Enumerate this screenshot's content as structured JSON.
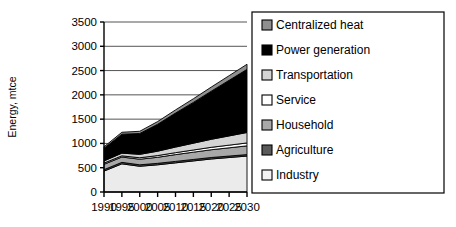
{
  "chart_data": {
    "type": "area",
    "title": "",
    "xlabel": "",
    "ylabel": "Energy, mtce",
    "categories": [
      "1990",
      "1995",
      "2000",
      "2005",
      "2010",
      "2015",
      "2020",
      "2025",
      "2030"
    ],
    "x": [
      1990,
      1995,
      2000,
      2005,
      2010,
      2015,
      2020,
      2025,
      2030
    ],
    "ylim": [
      0,
      3500
    ],
    "yticks": [
      0,
      500,
      1000,
      1500,
      2000,
      2500,
      3000,
      3500
    ],
    "ytick_labels": [
      "0",
      "500",
      "1000",
      "1500",
      "2000",
      "2500",
      "3000",
      "3500"
    ],
    "grid": true,
    "stacked": true,
    "legend_position": "right",
    "series": [
      {
        "name": "Industry",
        "color": "#ebebeb",
        "values": [
          430,
          580,
          530,
          560,
          600,
          640,
          680,
          710,
          740
        ]
      },
      {
        "name": "Agriculture",
        "color": "#5a5a5a",
        "values": [
          30,
          30,
          30,
          30,
          30,
          30,
          30,
          30,
          30
        ]
      },
      {
        "name": "Household",
        "color": "#a8a8a8",
        "values": [
          110,
          110,
          115,
          125,
          140,
          150,
          160,
          170,
          180
        ]
      },
      {
        "name": "Service",
        "color": "#ffffff",
        "values": [
          25,
          25,
          30,
          35,
          40,
          45,
          50,
          55,
          60
        ]
      },
      {
        "name": "Transportation",
        "color": "#d4d4d4",
        "values": [
          45,
          55,
          70,
          90,
          115,
          140,
          165,
          190,
          215
        ]
      },
      {
        "name": "Power generation",
        "color": "#000000",
        "values": [
          260,
          390,
          430,
          555,
          700,
          840,
          990,
          1145,
          1300
        ]
      },
      {
        "name": "Centralized heat",
        "color": "#8f8f8f",
        "values": [
          30,
          40,
          45,
          55,
          65,
          75,
          85,
          95,
          105
        ]
      }
    ],
    "legend_entries": [
      {
        "label": "Centralized heat",
        "color": "#8f8f8f"
      },
      {
        "label": "Power generation",
        "color": "#000000"
      },
      {
        "label": "Transportation",
        "color": "#d4d4d4"
      },
      {
        "label": "Service",
        "color": "#ffffff"
      },
      {
        "label": "Household",
        "color": "#a8a8a8"
      },
      {
        "label": "Agriculture",
        "color": "#5a5a5a"
      },
      {
        "label": "Industry",
        "color": "#f2f2f2"
      }
    ]
  }
}
